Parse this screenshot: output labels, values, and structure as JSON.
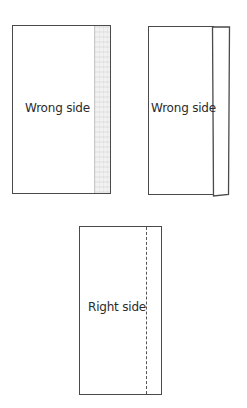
{
  "diagram": {
    "panels": [
      {
        "id": "panel-1",
        "label": "Wrong side",
        "feature": "shaded seam-allowance strip along right edge"
      },
      {
        "id": "panel-2",
        "label": "Wrong side",
        "feature": "right edge folded over forming a narrow flap"
      },
      {
        "id": "panel-3",
        "label": "Right side",
        "feature": "dashed stitch line near right edge"
      }
    ],
    "colors": {
      "outline": "#4a4a4a",
      "strip_fill": "#f1f1f1",
      "text": "#2b2b2b",
      "background": "#ffffff"
    }
  }
}
